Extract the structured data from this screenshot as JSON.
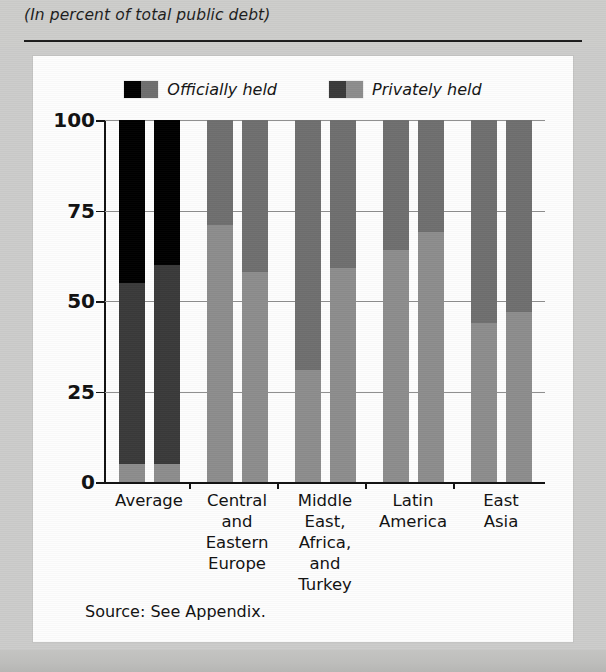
{
  "header": {
    "subtitle": "(In percent of total public debt)"
  },
  "legend": {
    "items": [
      {
        "label": "Officially held",
        "swatch_left": "#000000",
        "swatch_right": "#6f6f6f",
        "icon": "legend-swatch-icon"
      },
      {
        "label": "Privately held",
        "swatch_left": "#3a3a3a",
        "swatch_right": "#8d8d8d",
        "icon": "legend-swatch-icon"
      }
    ]
  },
  "source": {
    "text": "Source: See Appendix."
  },
  "colors": {
    "officially_held_dark": "#000000",
    "officially_held_gray": "#6f6f6f",
    "privately_held_dark": "#3a3a3a",
    "privately_held_gray": "#8d8d8d",
    "axis": "#111111",
    "gridline": "#8e8e8e",
    "card_background": "#fdfdfd",
    "page_background": "#cccccb"
  },
  "chart_data": {
    "type": "bar",
    "title": "",
    "subtitle": "(In percent of total public debt)",
    "xlabel": "",
    "ylabel": "",
    "ylim": [
      0,
      100
    ],
    "yticks": [
      0,
      25,
      50,
      75,
      100
    ],
    "ytick_labels": [
      "0",
      "25",
      "50",
      "75",
      "100"
    ],
    "grid": true,
    "stacked": true,
    "bars_per_group": 2,
    "legend_position": "top-center",
    "note": "Each group shows two stacked bars (e.g. two periods). Segments sum to 100 percent of total public debt. The 'Average' group is rendered in the darker officially-held/privately-held palette; the regional groups use the lighter paired palette.",
    "categories": [
      "Average",
      "Central and Eastern Europe",
      "Middle East, Africa, and Turkey",
      "Latin America",
      "East Asia"
    ],
    "category_label_lines": [
      [
        "Average"
      ],
      [
        "Central",
        "and",
        "Eastern",
        "Europe"
      ],
      [
        "Middle",
        "East,",
        "Africa,",
        "and",
        "Turkey"
      ],
      [
        "Latin",
        "America"
      ],
      [
        "East",
        "Asia"
      ]
    ],
    "groups": [
      {
        "category": "Average",
        "palette": "dark",
        "bars": [
          {
            "bar": 1,
            "segments": [
              {
                "name": "bottom",
                "from": 0,
                "to": 5,
                "value": 5,
                "color": "#8d8d8d"
              },
              {
                "name": "privately held",
                "from": 5,
                "to": 55,
                "value": 50,
                "color": "#3a3a3a"
              },
              {
                "name": "officially held",
                "from": 55,
                "to": 100,
                "value": 45,
                "color": "#000000"
              }
            ]
          },
          {
            "bar": 2,
            "segments": [
              {
                "name": "bottom",
                "from": 0,
                "to": 5,
                "value": 5,
                "color": "#8d8d8d"
              },
              {
                "name": "privately held",
                "from": 5,
                "to": 60,
                "value": 55,
                "color": "#3a3a3a"
              },
              {
                "name": "officially held",
                "from": 60,
                "to": 100,
                "value": 40,
                "color": "#000000"
              }
            ]
          }
        ]
      },
      {
        "category": "Central and Eastern Europe",
        "palette": "light",
        "bars": [
          {
            "bar": 1,
            "segments": [
              {
                "name": "privately held",
                "from": 0,
                "to": 71,
                "value": 71,
                "color": "#8d8d8d"
              },
              {
                "name": "officially held",
                "from": 71,
                "to": 100,
                "value": 29,
                "color": "#6f6f6f"
              }
            ]
          },
          {
            "bar": 2,
            "segments": [
              {
                "name": "privately held",
                "from": 0,
                "to": 58,
                "value": 58,
                "color": "#8d8d8d"
              },
              {
                "name": "officially held",
                "from": 58,
                "to": 100,
                "value": 42,
                "color": "#6f6f6f"
              }
            ]
          }
        ]
      },
      {
        "category": "Middle East, Africa, and Turkey",
        "palette": "light",
        "bars": [
          {
            "bar": 1,
            "segments": [
              {
                "name": "privately held",
                "from": 0,
                "to": 31,
                "value": 31,
                "color": "#8d8d8d"
              },
              {
                "name": "officially held",
                "from": 31,
                "to": 100,
                "value": 69,
                "color": "#6f6f6f"
              }
            ]
          },
          {
            "bar": 2,
            "segments": [
              {
                "name": "privately held",
                "from": 0,
                "to": 59,
                "value": 59,
                "color": "#8d8d8d"
              },
              {
                "name": "officially held",
                "from": 59,
                "to": 100,
                "value": 41,
                "color": "#6f6f6f"
              }
            ]
          }
        ]
      },
      {
        "category": "Latin America",
        "palette": "light",
        "bars": [
          {
            "bar": 1,
            "segments": [
              {
                "name": "privately held",
                "from": 0,
                "to": 64,
                "value": 64,
                "color": "#8d8d8d"
              },
              {
                "name": "officially held",
                "from": 64,
                "to": 100,
                "value": 36,
                "color": "#6f6f6f"
              }
            ]
          },
          {
            "bar": 2,
            "segments": [
              {
                "name": "privately held",
                "from": 0,
                "to": 69,
                "value": 69,
                "color": "#8d8d8d"
              },
              {
                "name": "officially held",
                "from": 69,
                "to": 100,
                "value": 31,
                "color": "#6f6f6f"
              }
            ]
          }
        ]
      },
      {
        "category": "East Asia",
        "palette": "light",
        "bars": [
          {
            "bar": 1,
            "segments": [
              {
                "name": "privately held",
                "from": 0,
                "to": 44,
                "value": 44,
                "color": "#8d8d8d"
              },
              {
                "name": "officially held",
                "from": 44,
                "to": 100,
                "value": 56,
                "color": "#6f6f6f"
              }
            ]
          },
          {
            "bar": 2,
            "segments": [
              {
                "name": "privately held",
                "from": 0,
                "to": 47,
                "value": 47,
                "color": "#8d8d8d"
              },
              {
                "name": "officially held",
                "from": 47,
                "to": 100,
                "value": 53,
                "color": "#6f6f6f"
              }
            ]
          }
        ]
      }
    ]
  }
}
